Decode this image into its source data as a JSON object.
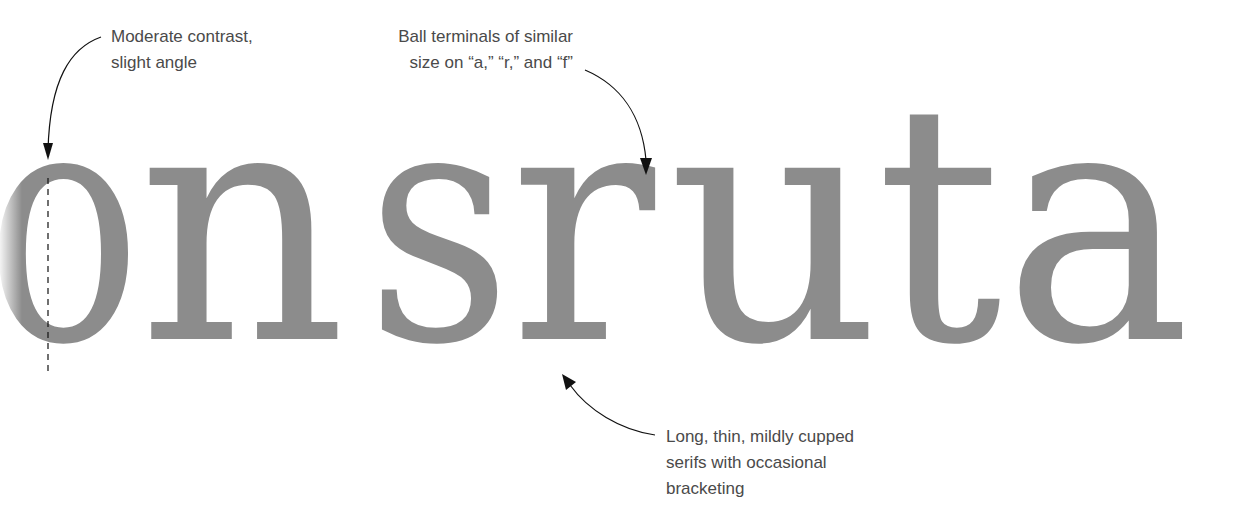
{
  "specimen": {
    "word": "onsruta",
    "letters": [
      "o",
      "n",
      "s",
      "r",
      "u",
      "t",
      "a"
    ],
    "glyph_color": "#8c8c8c",
    "annotation_color": "#4a4a4a",
    "arrow_color": "#111111"
  },
  "annotations": [
    {
      "id": "contrast",
      "lines": [
        "Moderate contrast,",
        "slight angle"
      ],
      "points_to": "stress axis of o (dashed line)"
    },
    {
      "id": "terminals",
      "lines": [
        "Ball terminals of similar",
        "size on “a,” “r,” and “f”"
      ],
      "points_to": "ball terminal of r"
    },
    {
      "id": "serifs",
      "lines": [
        "Long, thin, mildly cupped",
        "serifs with occasional",
        "bracketing"
      ],
      "points_to": "foot serif of r"
    }
  ]
}
